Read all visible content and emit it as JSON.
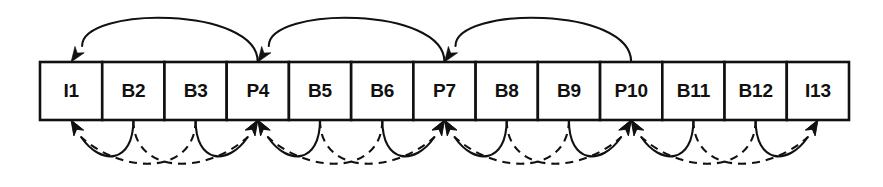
{
  "diagram": {
    "type": "mpeg-gop-frame-dependency",
    "colors": {
      "stroke": "#111111",
      "background": "#ffffff",
      "box_fill": "#ffffff"
    },
    "geometry": {
      "row_left": 40,
      "row_right": 849,
      "row_top": 62,
      "row_bottom": 120,
      "box_count": 13,
      "box_width": 62.23
    },
    "frames": [
      {
        "index": 0,
        "label": "I1",
        "type": "I",
        "center_x": 71.1
      },
      {
        "index": 1,
        "label": "B2",
        "type": "B",
        "center_x": 133.4
      },
      {
        "index": 2,
        "label": "B3",
        "type": "B",
        "center_x": 195.6
      },
      {
        "index": 3,
        "label": "P4",
        "type": "P",
        "center_x": 257.8
      },
      {
        "index": 4,
        "label": "B5",
        "type": "B",
        "center_x": 320.0
      },
      {
        "index": 5,
        "label": "B6",
        "type": "B",
        "center_x": 382.3
      },
      {
        "index": 6,
        "label": "P7",
        "type": "P",
        "center_x": 444.5
      },
      {
        "index": 7,
        "label": "B8",
        "type": "B",
        "center_x": 506.7
      },
      {
        "index": 8,
        "label": "B9",
        "type": "B",
        "center_x": 568.9
      },
      {
        "index": 9,
        "label": "P10",
        "type": "P",
        "center_x": 631.2
      },
      {
        "index": 10,
        "label": "B11",
        "type": "B",
        "center_x": 693.4
      },
      {
        "index": 11,
        "label": "B12",
        "type": "B",
        "center_x": 755.6
      },
      {
        "index": 12,
        "label": "I13",
        "type": "I",
        "center_x": 817.9
      }
    ],
    "top_arcs": [
      {
        "name": "p4-predicts-from-i1",
        "from_label": "P4",
        "to_label": "I1",
        "from_x": 257.8,
        "to_x": 71.1,
        "style": "solid",
        "apex_y": 12,
        "arrow_at": "to"
      },
      {
        "name": "p7-predicts-from-p4",
        "from_label": "P7",
        "to_label": "P4",
        "from_x": 444.5,
        "to_x": 257.8,
        "style": "solid",
        "apex_y": 12,
        "arrow_at": "to"
      },
      {
        "name": "p10-predicts-from-p7",
        "from_label": "P10",
        "to_label": "P7",
        "from_x": 631.2,
        "to_x": 444.5,
        "style": "solid",
        "apex_y": 12,
        "arrow_at": "to"
      }
    ],
    "bottom_arcs": [
      {
        "name": "b2-backward-to-i1",
        "from_label": "B2",
        "to_label": "I1",
        "from_x": 133.4,
        "to_x": 71.1,
        "style": "solid",
        "depth": 34,
        "arrow_at": "to"
      },
      {
        "name": "b3-backward-to-i1",
        "from_label": "B3",
        "to_label": "I1",
        "from_x": 195.6,
        "to_x": 71.1,
        "style": "dashed",
        "depth": 44,
        "arrow_at": "to"
      },
      {
        "name": "b3-forward-to-p4",
        "from_label": "B3",
        "to_label": "P4",
        "from_x": 195.6,
        "to_x": 257.8,
        "style": "solid",
        "depth": 34,
        "arrow_at": "to"
      },
      {
        "name": "b2-forward-to-p4",
        "from_label": "B2",
        "to_label": "P4",
        "from_x": 133.4,
        "to_x": 257.8,
        "style": "dashed",
        "depth": 44,
        "arrow_at": "to"
      },
      {
        "name": "b5-backward-to-p4",
        "from_label": "B5",
        "to_label": "P4",
        "from_x": 320.0,
        "to_x": 257.8,
        "style": "solid",
        "depth": 34,
        "arrow_at": "to"
      },
      {
        "name": "b6-backward-to-p4",
        "from_label": "B6",
        "to_label": "P4",
        "from_x": 382.3,
        "to_x": 257.8,
        "style": "dashed",
        "depth": 44,
        "arrow_at": "to"
      },
      {
        "name": "b6-forward-to-p7",
        "from_label": "B6",
        "to_label": "P7",
        "from_x": 382.3,
        "to_x": 444.5,
        "style": "solid",
        "depth": 34,
        "arrow_at": "to"
      },
      {
        "name": "b5-forward-to-p7",
        "from_label": "B5",
        "to_label": "P7",
        "from_x": 320.0,
        "to_x": 444.5,
        "style": "dashed",
        "depth": 44,
        "arrow_at": "to"
      },
      {
        "name": "b8-backward-to-p7",
        "from_label": "B8",
        "to_label": "P7",
        "from_x": 506.7,
        "to_x": 444.5,
        "style": "solid",
        "depth": 34,
        "arrow_at": "to"
      },
      {
        "name": "b9-backward-to-p7",
        "from_label": "B9",
        "to_label": "P7",
        "from_x": 568.9,
        "to_x": 444.5,
        "style": "dashed",
        "depth": 44,
        "arrow_at": "to"
      },
      {
        "name": "b9-forward-to-p10",
        "from_label": "B9",
        "to_label": "P10",
        "from_x": 568.9,
        "to_x": 631.2,
        "style": "solid",
        "depth": 34,
        "arrow_at": "to"
      },
      {
        "name": "b8-forward-to-p10",
        "from_label": "B8",
        "to_label": "P10",
        "from_x": 506.7,
        "to_x": 631.2,
        "style": "dashed",
        "depth": 44,
        "arrow_at": "to"
      },
      {
        "name": "b11-backward-to-p10",
        "from_label": "B11",
        "to_label": "P10",
        "from_x": 693.4,
        "to_x": 631.2,
        "style": "solid",
        "depth": 34,
        "arrow_at": "to"
      },
      {
        "name": "b12-backward-to-p10",
        "from_label": "B12",
        "to_label": "P10",
        "from_x": 755.6,
        "to_x": 631.2,
        "style": "dashed",
        "depth": 44,
        "arrow_at": "to"
      },
      {
        "name": "b12-forward-to-i13",
        "from_label": "B12",
        "to_label": "I13",
        "from_x": 755.6,
        "to_x": 817.9,
        "style": "solid",
        "depth": 34,
        "arrow_at": "to"
      },
      {
        "name": "b11-forward-to-i13",
        "from_label": "B11",
        "to_label": "I13",
        "from_x": 693.4,
        "to_x": 817.9,
        "style": "dashed",
        "depth": 44,
        "arrow_at": "to"
      }
    ]
  }
}
